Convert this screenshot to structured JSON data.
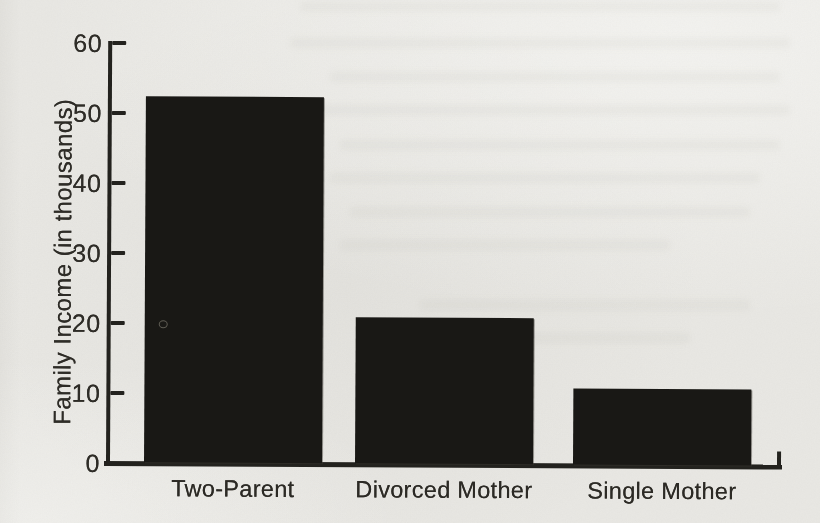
{
  "figure": {
    "background_color": "#e9e8e4",
    "bar_color": "#191815",
    "axis_color": "#23221e",
    "text_color": "#2e2c27"
  },
  "chart_data": {
    "type": "bar",
    "title": "",
    "categories": [
      "Two-Parent",
      "Divorced Mother",
      "Single Mother"
    ],
    "values": [
      52.5,
      21,
      11
    ],
    "xlabel": "",
    "ylabel": "Family Income (in thousands)",
    "ylim": [
      0,
      60
    ],
    "yticks": [
      0,
      10,
      20,
      30,
      40,
      50,
      60
    ],
    "grid": false,
    "legend_position": "none",
    "bar_color": "#191815"
  }
}
